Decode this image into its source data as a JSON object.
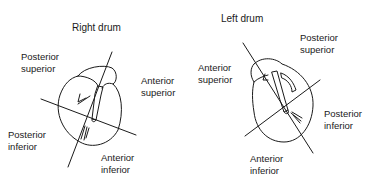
{
  "right_drum": {
    "title": "Right drum",
    "labels": {
      "posterior_superior": "Posterior\nsuperior",
      "anterior_superior": "Anterior\nsuperior",
      "posterior_inferior": "Posterior\ninferior",
      "anterior_inferior": "Anterior\ninferior"
    }
  },
  "left_drum": {
    "title": "Left drum",
    "labels": {
      "posterior_superior": "Posterior\nsuperior",
      "anterior_superior": "Anterior\nsuperior",
      "posterior_inferior": "Posterior\ninferior",
      "anterior_inferior": "Anterior\ninferior"
    }
  },
  "colors": {
    "ink": "#1a1a1a",
    "background": "#ffffff"
  }
}
